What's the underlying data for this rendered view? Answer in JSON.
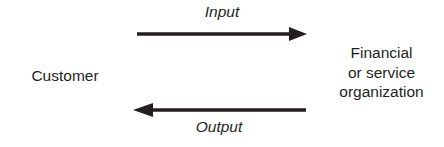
{
  "diagram": {
    "background_color": "#ffffff",
    "stroke_color": "#231f20",
    "text_color": "#231f20",
    "nodes": {
      "customer": {
        "label": "Customer"
      },
      "organization": {
        "label": "Financial\nor service\norganization"
      }
    },
    "flows": {
      "input": {
        "label": "Input",
        "direction": "right",
        "from": "Customer",
        "to": "Financial or service organization"
      },
      "output": {
        "label": "Output",
        "direction": "left",
        "from": "Financial or service organization",
        "to": "Customer"
      }
    }
  }
}
